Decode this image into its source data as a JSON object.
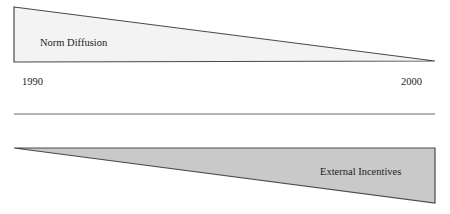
{
  "diagram": {
    "type": "conceptual-timeline",
    "top_wedge": {
      "label": "Norm Diffusion",
      "fill": "#f3f3f3",
      "stroke": "#4a4a4a",
      "trend": "decreasing"
    },
    "bottom_wedge": {
      "label": "External Incentives",
      "fill": "#c9c9c9",
      "stroke": "#4a4a4a",
      "trend": "increasing"
    },
    "timeline": {
      "start_label": "1990",
      "end_label": "2000",
      "axis_color": "#6a6a6a"
    }
  }
}
